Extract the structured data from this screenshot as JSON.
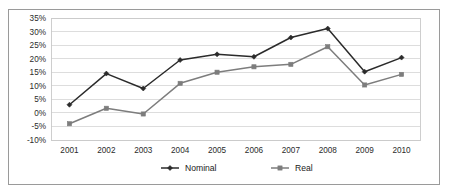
{
  "chart_data": {
    "type": "line",
    "title": "",
    "subtitle": "",
    "xlabel": "",
    "ylabel": "",
    "categories": [
      "2001",
      "2002",
      "2003",
      "2004",
      "2005",
      "2006",
      "2007",
      "2008",
      "2009",
      "2010"
    ],
    "x": [
      2001,
      2002,
      2003,
      2004,
      2005,
      2006,
      2007,
      2008,
      2009,
      2010
    ],
    "series": [
      {
        "name": "Nominal",
        "color": "#2b2b2b",
        "marker": "diamond",
        "values": [
          3.0,
          14.5,
          9.0,
          19.5,
          21.6,
          20.7,
          27.8,
          31.1,
          15.2,
          20.4
        ]
      },
      {
        "name": "Real",
        "color": "#7d7d7d",
        "marker": "square",
        "values": [
          -4.0,
          1.7,
          -0.4,
          10.9,
          15.0,
          17.0,
          17.9,
          24.4,
          10.3,
          14.2
        ]
      }
    ],
    "ylim": [
      -10,
      35
    ],
    "ytick_values": [
      35,
      30,
      25,
      20,
      15,
      10,
      5,
      0,
      -5,
      -10
    ],
    "ytick_labels": [
      "35%",
      "30%",
      "25%",
      "20%",
      "15%",
      "10%",
      "5%",
      "0%",
      "-5%",
      "-10%"
    ],
    "xtick_labels": [
      "2001",
      "2002",
      "2003",
      "2004",
      "2005",
      "2006",
      "2007",
      "2008",
      "2009",
      "2010"
    ],
    "grid": true,
    "grid_axis": "y",
    "legend": true,
    "legend_position": "bottom",
    "legend_entries": [
      "Nominal",
      "Real"
    ]
  },
  "colors": {
    "nominal": "#2b2b2b",
    "real": "#7d7d7d",
    "gridline": "#d4d4d4",
    "frame_border": "#9a9a9a",
    "background": "#ffffff",
    "text": "#2b2b2b"
  }
}
